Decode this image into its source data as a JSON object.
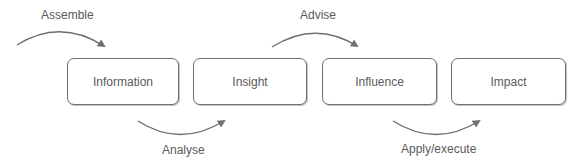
{
  "diagram": {
    "stages": [
      {
        "label": "Information"
      },
      {
        "label": "Insight"
      },
      {
        "label": "Influence"
      },
      {
        "label": "Impact"
      }
    ],
    "transitions": [
      {
        "label": "Assemble",
        "position": "top",
        "into": "Information"
      },
      {
        "label": "Analyse",
        "position": "bottom",
        "from": "Information",
        "to": "Insight"
      },
      {
        "label": "Advise",
        "position": "top",
        "from": "Insight",
        "to": "Influence"
      },
      {
        "label": "Apply/execute",
        "position": "bottom",
        "from": "Influence",
        "to": "Impact"
      }
    ],
    "colors": {
      "stroke": "#6f6f6f",
      "text": "#5a5a5a",
      "background": "#ffffff"
    }
  }
}
